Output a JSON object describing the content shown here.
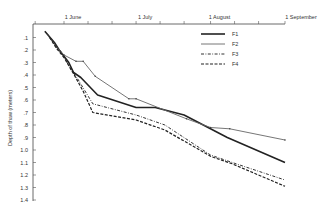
{
  "chart_data": {
    "type": "line",
    "title": "",
    "xlabel": "",
    "ylabel": "Depth of thaw (meters)",
    "x_axis_position": "top",
    "y_inverted": true,
    "ylim": [
      0,
      1.4
    ],
    "y_ticks": [
      ".1",
      ".2",
      ".3",
      ".4",
      ".5",
      ".6",
      ".7",
      ".8",
      ".9",
      "1.0",
      "1.1",
      "1.2",
      "1.3",
      "1.4"
    ],
    "x_ticks": [
      {
        "label": "1 June",
        "day": 0
      },
      {
        "label": "1 July",
        "day": 30
      },
      {
        "label": "1 August",
        "day": 61
      },
      {
        "label": "1 September",
        "day": 92
      }
    ],
    "x_minor_tick_days": [
      -12,
      0,
      10,
      20,
      30,
      40,
      50,
      61,
      71,
      81,
      92
    ],
    "grid": false,
    "legend": {
      "position": "upper-right-inside",
      "entries": [
        "F1",
        "F2",
        "F3",
        "F4"
      ]
    },
    "series": [
      {
        "name": "F1",
        "style": "solid-thick",
        "points": [
          [
            -8,
            0.05
          ],
          [
            -4,
            0.14
          ],
          [
            -2,
            0.2
          ],
          [
            2,
            0.3
          ],
          [
            4,
            0.38
          ],
          [
            7,
            0.42
          ],
          [
            14,
            0.56
          ],
          [
            30,
            0.66
          ],
          [
            38,
            0.66
          ],
          [
            50,
            0.72
          ],
          [
            61,
            0.83
          ],
          [
            68,
            0.9
          ],
          [
            92,
            1.1
          ]
        ]
      },
      {
        "name": "F2",
        "style": "solid-thin",
        "points": [
          [
            -6,
            0.1
          ],
          [
            -3,
            0.18
          ],
          [
            0,
            0.24
          ],
          [
            5,
            0.29
          ],
          [
            8,
            0.29
          ],
          [
            13,
            0.41
          ],
          [
            27,
            0.59
          ],
          [
            30,
            0.59
          ],
          [
            51,
            0.75
          ],
          [
            61,
            0.82
          ],
          [
            69,
            0.83
          ],
          [
            92,
            0.92
          ]
        ]
      },
      {
        "name": "F3",
        "style": "dash-dot",
        "points": [
          [
            -7,
            0.07
          ],
          [
            -4,
            0.15
          ],
          [
            -1,
            0.22
          ],
          [
            3,
            0.36
          ],
          [
            6,
            0.44
          ],
          [
            12,
            0.63
          ],
          [
            20,
            0.67
          ],
          [
            30,
            0.72
          ],
          [
            42,
            0.8
          ],
          [
            61,
            1.04
          ],
          [
            70,
            1.1
          ],
          [
            92,
            1.24
          ]
        ]
      },
      {
        "name": "F4",
        "style": "dashed",
        "points": [
          [
            -6,
            0.1
          ],
          [
            -3,
            0.19
          ],
          [
            0,
            0.26
          ],
          [
            4,
            0.39
          ],
          [
            8,
            0.53
          ],
          [
            12,
            0.7
          ],
          [
            30,
            0.76
          ],
          [
            42,
            0.84
          ],
          [
            61,
            1.05
          ],
          [
            70,
            1.11
          ],
          [
            92,
            1.29
          ]
        ]
      }
    ]
  },
  "ui": {
    "ylabel_text": "Depth of thaw (meters)"
  }
}
